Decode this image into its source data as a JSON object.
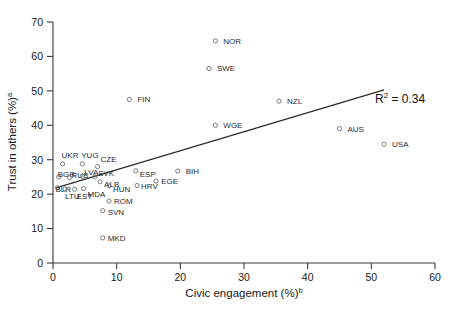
{
  "chart_data": {
    "type": "scatter",
    "title": "",
    "xlabel": "Civic engagement (%)",
    "xlabel_sup": "b",
    "ylabel": "Trust in others (%)",
    "ylabel_sup": "a",
    "xlim": [
      0,
      60
    ],
    "ylim": [
      0,
      70
    ],
    "xticks": [
      0,
      10,
      20,
      30,
      40,
      50,
      60
    ],
    "yticks": [
      0,
      10,
      20,
      30,
      40,
      50,
      60,
      70
    ],
    "grid": false,
    "legend": "none",
    "marker_style": "open-circle",
    "marker_color": "#6d6d6d",
    "line_color": "#2b2b2b",
    "annotations": [
      {
        "name": "r2",
        "text_main": "R",
        "text_sup": "2",
        "text_tail": " = 0.34",
        "full": "R2 = 0.34",
        "x": 47.5,
        "y": 45.5
      }
    ],
    "trendline": {
      "type": "linear",
      "r_squared": 0.34,
      "x_start": 0.6,
      "y_start": 21.9,
      "x_end": 52.0,
      "y_end": 50.3
    },
    "points": [
      {
        "label": "NOR",
        "x": 25.5,
        "y": 64.5,
        "lx": 8,
        "ly": 3
      },
      {
        "label": "SWE",
        "x": 24.5,
        "y": 56.5,
        "lx": 8,
        "ly": 3
      },
      {
        "label": "FIN",
        "x": 12.0,
        "y": 47.5,
        "lx": 8,
        "ly": 3
      },
      {
        "label": "NZL",
        "x": 35.5,
        "y": 47.0,
        "lx": 8,
        "ly": 3
      },
      {
        "label": "WGE",
        "x": 25.5,
        "y": 40.0,
        "lx": 8,
        "ly": 3
      },
      {
        "label": "AUS",
        "x": 45.0,
        "y": 39.0,
        "lx": 8,
        "ly": 3
      },
      {
        "label": "USA",
        "x": 52.0,
        "y": 34.5,
        "lx": 8,
        "ly": 3
      },
      {
        "label": "UKR",
        "x": 1.5,
        "y": 28.8,
        "lx": -1,
        "ly": -6
      },
      {
        "label": "YUG",
        "x": 4.6,
        "y": 28.8,
        "lx": -1,
        "ly": -6
      },
      {
        "label": "CZE",
        "x": 7.0,
        "y": 28.0,
        "lx": 3,
        "ly": -5
      },
      {
        "label": "ESP",
        "x": 13.0,
        "y": 26.8,
        "lx": 4,
        "ly": 6
      },
      {
        "label": "BIH",
        "x": 19.6,
        "y": 26.7,
        "lx": 8,
        "ly": 3
      },
      {
        "label": "BGR",
        "x": 0.9,
        "y": 25.0,
        "lx": -1,
        "ly": 0
      },
      {
        "label": "RUS",
        "x": 2.6,
        "y": 24.8,
        "lx": 2,
        "ly": 0
      },
      {
        "label": "LVA",
        "x": 4.6,
        "y": 25.2,
        "lx": 2,
        "ly": -1
      },
      {
        "label": "SVK",
        "x": 6.6,
        "y": 25.0,
        "lx": 3,
        "ly": -1
      },
      {
        "label": "ALB",
        "x": 7.4,
        "y": 23.6,
        "lx": 4,
        "ly": 5
      },
      {
        "label": "HUN",
        "x": 8.8,
        "y": 22.4,
        "lx": 4,
        "ly": 6
      },
      {
        "label": "HRV",
        "x": 13.2,
        "y": 22.5,
        "lx": 4,
        "ly": 3
      },
      {
        "label": "EGE",
        "x": 16.2,
        "y": 23.8,
        "lx": 5,
        "ly": 3
      },
      {
        "label": "BLR",
        "x": 0.7,
        "y": 21.9,
        "lx": -2,
        "ly": 4
      },
      {
        "label": "LTU",
        "x": 1.9,
        "y": 21.5,
        "lx": 0,
        "ly": 10
      },
      {
        "label": "EST",
        "x": 3.4,
        "y": 21.4,
        "lx": 2,
        "ly": 10
      },
      {
        "label": "MDA",
        "x": 4.8,
        "y": 21.6,
        "lx": 4,
        "ly": 8
      },
      {
        "label": "ROM",
        "x": 8.8,
        "y": 18.0,
        "lx": 5,
        "ly": 3
      },
      {
        "label": "SVN",
        "x": 7.8,
        "y": 15.2,
        "lx": 5,
        "ly": 4
      },
      {
        "label": "MKD",
        "x": 7.8,
        "y": 7.3,
        "lx": 5,
        "ly": 3
      }
    ]
  }
}
